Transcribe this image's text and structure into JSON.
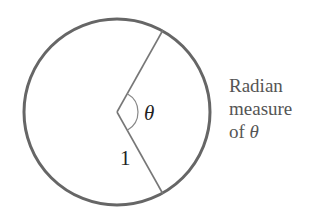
{
  "diagram": {
    "circle": {
      "cx": 117,
      "cy": 112,
      "r": 93,
      "stroke": "#666666",
      "stroke_width": 3
    },
    "center": {
      "x": 117,
      "y": 112
    },
    "radius_lines": [
      {
        "x1": 117,
        "y1": 112,
        "x2": 163,
        "y2": 30
      },
      {
        "x1": 117,
        "y1": 112,
        "x2": 163,
        "y2": 194
      }
    ],
    "angle_label": "θ",
    "radius_label": "1",
    "caption": {
      "line1": "Radian",
      "line2": "measure",
      "line3_prefix": "of ",
      "line3_symbol": "θ"
    }
  }
}
